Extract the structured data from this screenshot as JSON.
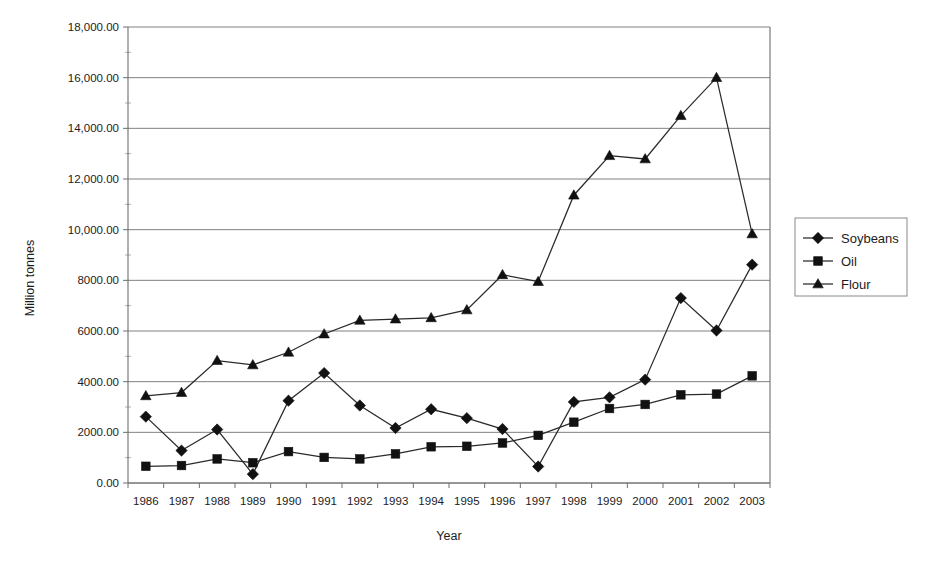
{
  "chart_data": {
    "type": "line",
    "title": "",
    "xlabel": "Year",
    "ylabel": "Million tonnes",
    "x": [
      1986,
      1987,
      1988,
      1989,
      1990,
      1991,
      1992,
      1993,
      1994,
      1995,
      1996,
      1997,
      1998,
      1999,
      2000,
      2001,
      2002,
      2003
    ],
    "xtick_labels": [
      "1986",
      "1987",
      "1988",
      "1989",
      "1990",
      "1991",
      "1992",
      "1993",
      "1994",
      "1995",
      "1996",
      "1997",
      "1998",
      "1999",
      "2000",
      "2001",
      "2002",
      "2003"
    ],
    "ytick_labels": [
      "0.00",
      "2000.00",
      "4000.00",
      "6000.00",
      "8000.00",
      "10,000.00",
      "12,000.00",
      "14,000.00",
      "16,000.00",
      "18,000.00"
    ],
    "ytick_values": [
      0,
      2000,
      4000,
      6000,
      8000,
      10000,
      12000,
      14000,
      16000,
      18000
    ],
    "ylim": [
      0,
      18000
    ],
    "grid": true,
    "legend_position": "right",
    "series": [
      {
        "name": "Soybeans",
        "marker": "diamond",
        "values": [
          2620,
          1280,
          2110,
          350,
          3250,
          4340,
          3060,
          2170,
          2910,
          2560,
          2130,
          650,
          3200,
          3380,
          4080,
          7300,
          6020,
          8620
        ]
      },
      {
        "name": "Oil",
        "marker": "square",
        "values": [
          660,
          690,
          950,
          800,
          1240,
          1010,
          950,
          1150,
          1430,
          1450,
          1580,
          1880,
          2400,
          2940,
          3100,
          3480,
          3510,
          4230
        ]
      },
      {
        "name": "Flour",
        "marker": "triangle",
        "values": [
          3440,
          3570,
          4830,
          4660,
          5160,
          5880,
          6420,
          6470,
          6520,
          6830,
          8220,
          7950,
          11360,
          12920,
          12790,
          14500,
          16000,
          9830
        ]
      }
    ]
  },
  "legend": {
    "entries": [
      {
        "label": "Soybeans",
        "marker": "diamond"
      },
      {
        "label": "Oil",
        "marker": "square"
      },
      {
        "label": "Flour",
        "marker": "triangle"
      }
    ]
  },
  "axes": {
    "x_title": "Year",
    "y_title": "Million tonnes"
  }
}
